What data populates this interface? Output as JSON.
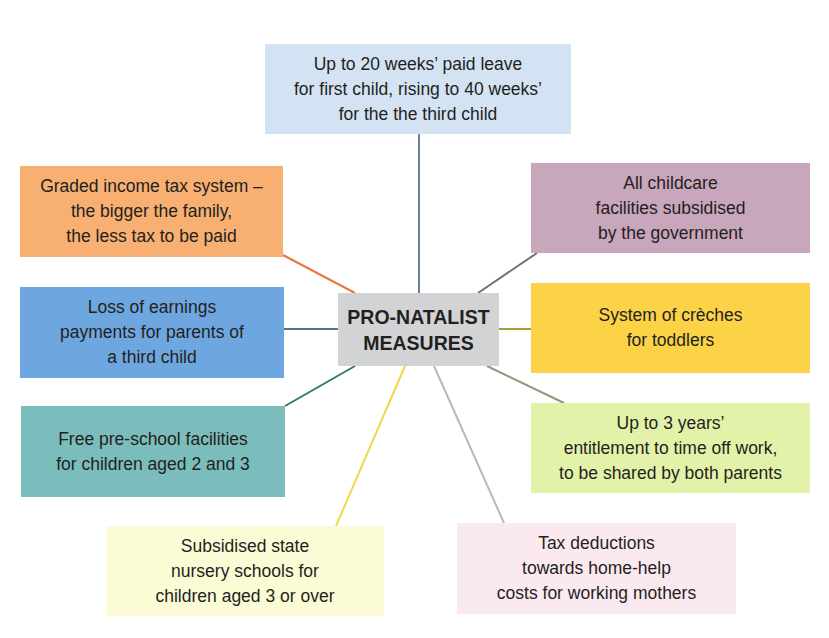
{
  "diagram": {
    "type": "spider-diagram",
    "center": {
      "label": "PRO-NATALIST\nMEASURES",
      "color": "#d2d3d5",
      "x": 338,
      "y": 293,
      "w": 161,
      "h": 73
    },
    "nodes": [
      {
        "id": "paid-leave",
        "label": "Up to 20 weeks’ paid leave\nfor first child, rising to 40 weeks’\nfor the the third child",
        "color": "#d4e3f4",
        "line": "#6d7f9e",
        "x": 265,
        "y": 44,
        "w": 306,
        "h": 90,
        "from": [
          419,
          134
        ],
        "to": [
          419,
          293
        ]
      },
      {
        "id": "graded-tax",
        "label": "Graded income tax system –\nthe bigger the family,\nthe less tax to be paid",
        "color": "#f7b071",
        "line": "#e8783a",
        "x": 20,
        "y": 166,
        "w": 263,
        "h": 91,
        "from": [
          283,
          255
        ],
        "to": [
          355,
          293
        ]
      },
      {
        "id": "childcare-subsidy",
        "label": "All childcare\nfacilities subsidised\nby the government",
        "color": "#c8a6bb",
        "line": "#7c6b72",
        "x": 531,
        "y": 163,
        "w": 279,
        "h": 90,
        "from": [
          537,
          253
        ],
        "to": [
          478,
          293
        ]
      },
      {
        "id": "loss-of-earnings",
        "label": "Loss of earnings\npayments for parents of\na third child",
        "color": "#6ea7df",
        "line": "#5a6f8c",
        "x": 20,
        "y": 287,
        "w": 264,
        "h": 91,
        "from": [
          284,
          329
        ],
        "to": [
          338,
          329
        ]
      },
      {
        "id": "creches",
        "label": "System of crèches\nfor toddlers",
        "color": "#fcd246",
        "line": "#a39c3a",
        "x": 531,
        "y": 283,
        "w": 279,
        "h": 90,
        "from": [
          499,
          329
        ],
        "to": [
          531,
          329
        ]
      },
      {
        "id": "pre-school",
        "label": "Free pre-school facilities\nfor children aged 2 and 3",
        "color": "#7bbcbc",
        "line": "#2e7a6b",
        "x": 21,
        "y": 406,
        "w": 264,
        "h": 91,
        "from": [
          285,
          406
        ],
        "to": [
          355,
          366
        ]
      },
      {
        "id": "time-off-work",
        "label": "Up to 3 years’\nentitlement to time off work,\nto be shared by both parents",
        "color": "#e3f2a9",
        "line": "#8f9a7e",
        "x": 531,
        "y": 403,
        "w": 279,
        "h": 90,
        "from": [
          487,
          366
        ],
        "to": [
          564,
          403
        ]
      },
      {
        "id": "nursery-schools",
        "label": "Subsidised state\nnursery schools for\nchildren aged 3 or over",
        "color": "#fbfbd6",
        "line": "#f0d84a",
        "x": 106,
        "y": 526,
        "w": 278,
        "h": 90,
        "from": [
          405,
          366
        ],
        "to": [
          336,
          526
        ]
      },
      {
        "id": "tax-deductions",
        "label": "Tax deductions\ntowards home-help\ncosts for working mothers",
        "color": "#fbe9f0",
        "line": "#b9b6c4",
        "x": 457,
        "y": 523,
        "w": 279,
        "h": 91,
        "from": [
          434,
          366
        ],
        "to": [
          504,
          523
        ]
      }
    ]
  }
}
